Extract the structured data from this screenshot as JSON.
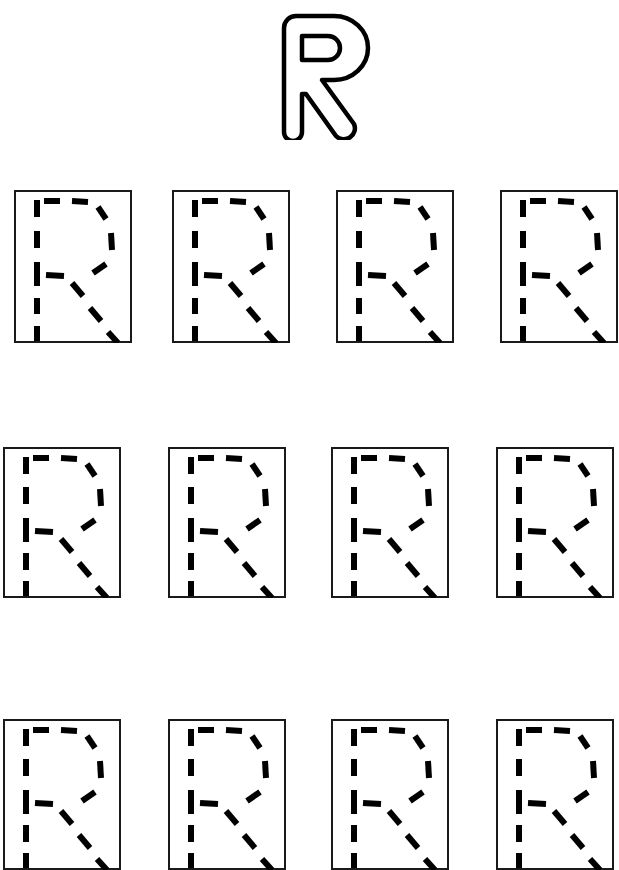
{
  "worksheet": {
    "letter": "R",
    "title_letter_style": "outline-bubble",
    "trace_letter_style": "dashed",
    "background_color": "#ffffff",
    "ink_color": "#000000",
    "box_border_color": "#1a1a1a",
    "rows": [
      {
        "row_index": 1,
        "boxes": [
          {
            "letter": "R",
            "x": 14,
            "y": 190,
            "width": 118,
            "height": 153,
            "clipped": false
          },
          {
            "letter": "R",
            "x": 172,
            "y": 190,
            "width": 118,
            "height": 153,
            "clipped": false
          },
          {
            "letter": "R",
            "x": 336,
            "y": 190,
            "width": 118,
            "height": 153,
            "clipped": false
          },
          {
            "letter": "R",
            "x": 500,
            "y": 190,
            "width": 118,
            "height": 153,
            "clipped": true
          }
        ]
      },
      {
        "row_index": 2,
        "boxes": [
          {
            "letter": "R",
            "x": 3,
            "y": 447,
            "width": 118,
            "height": 151,
            "clipped": false
          },
          {
            "letter": "R",
            "x": 168,
            "y": 447,
            "width": 118,
            "height": 151,
            "clipped": false
          },
          {
            "letter": "R",
            "x": 331,
            "y": 447,
            "width": 118,
            "height": 151,
            "clipped": false
          },
          {
            "letter": "R",
            "x": 496,
            "y": 447,
            "width": 118,
            "height": 151,
            "clipped": false
          }
        ]
      },
      {
        "row_index": 3,
        "boxes": [
          {
            "letter": "R",
            "x": 3,
            "y": 719,
            "width": 118,
            "height": 151,
            "clipped": true
          },
          {
            "letter": "R",
            "x": 168,
            "y": 719,
            "width": 118,
            "height": 151,
            "clipped": true
          },
          {
            "letter": "R",
            "x": 331,
            "y": 719,
            "width": 118,
            "height": 151,
            "clipped": true
          },
          {
            "letter": "R",
            "x": 496,
            "y": 719,
            "width": 118,
            "height": 151,
            "clipped": true
          }
        ]
      }
    ]
  }
}
